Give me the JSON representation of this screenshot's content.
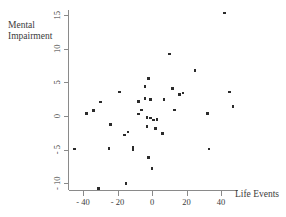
{
  "chart_data": {
    "type": "scatter",
    "title": "",
    "xlabel": "Life Events",
    "ylabel": "Mental Impairment",
    "xlim": [
      -50,
      50
    ],
    "ylim": [
      -12,
      16
    ],
    "xticks": [
      -40,
      -20,
      0,
      20,
      40
    ],
    "xtick_labels": [
      "- 40",
      "- 20",
      "0",
      "20",
      "40"
    ],
    "yticks": [
      -10,
      -5,
      0,
      5,
      10,
      15
    ],
    "ytick_labels": [
      "- 10",
      "- 5",
      "0",
      "5",
      "10",
      "15"
    ],
    "grid": false,
    "legend": null,
    "marker": "square",
    "marker_color": "#2b2b2b",
    "points": [
      {
        "x": -45,
        "y": -4.9
      },
      {
        "x": -38,
        "y": 0.4
      },
      {
        "x": -34,
        "y": 0.8
      },
      {
        "x": -31,
        "y": -10.8
      },
      {
        "x": -30,
        "y": 2.1
      },
      {
        "x": -25,
        "y": -4.8
      },
      {
        "x": -24,
        "y": -1.3
      },
      {
        "x": -19,
        "y": 3.6
      },
      {
        "x": -16,
        "y": -2.8
      },
      {
        "x": -15,
        "y": -10.0
      },
      {
        "x": -14,
        "y": -2.4
      },
      {
        "x": -11,
        "y": -5.0
      },
      {
        "x": -11,
        "y": -4.6
      },
      {
        "x": -8,
        "y": 2.2
      },
      {
        "x": -8,
        "y": 0.3
      },
      {
        "x": -6,
        "y": 0.9
      },
      {
        "x": -4,
        "y": 4.4
      },
      {
        "x": -4,
        "y": 2.6
      },
      {
        "x": -3,
        "y": -0.2
      },
      {
        "x": -3,
        "y": -1.6
      },
      {
        "x": -2,
        "y": 5.6
      },
      {
        "x": -2,
        "y": -6.2
      },
      {
        "x": -1,
        "y": 2.5
      },
      {
        "x": -1,
        "y": -0.3
      },
      {
        "x": 0,
        "y": -7.8
      },
      {
        "x": 1,
        "y": -0.6
      },
      {
        "x": 2,
        "y": -1.9
      },
      {
        "x": 3,
        "y": -0.5
      },
      {
        "x": 6,
        "y": -2.6
      },
      {
        "x": 7,
        "y": 2.5
      },
      {
        "x": 10,
        "y": 9.2
      },
      {
        "x": 12,
        "y": 4.1
      },
      {
        "x": 13,
        "y": 0.9
      },
      {
        "x": 16,
        "y": 3.2
      },
      {
        "x": 18,
        "y": 3.4
      },
      {
        "x": 25,
        "y": 6.8
      },
      {
        "x": 32,
        "y": 0.4
      },
      {
        "x": 33,
        "y": -4.9
      },
      {
        "x": 42,
        "y": 15.3
      },
      {
        "x": 45,
        "y": 3.6
      },
      {
        "x": 47,
        "y": 1.4
      }
    ]
  }
}
